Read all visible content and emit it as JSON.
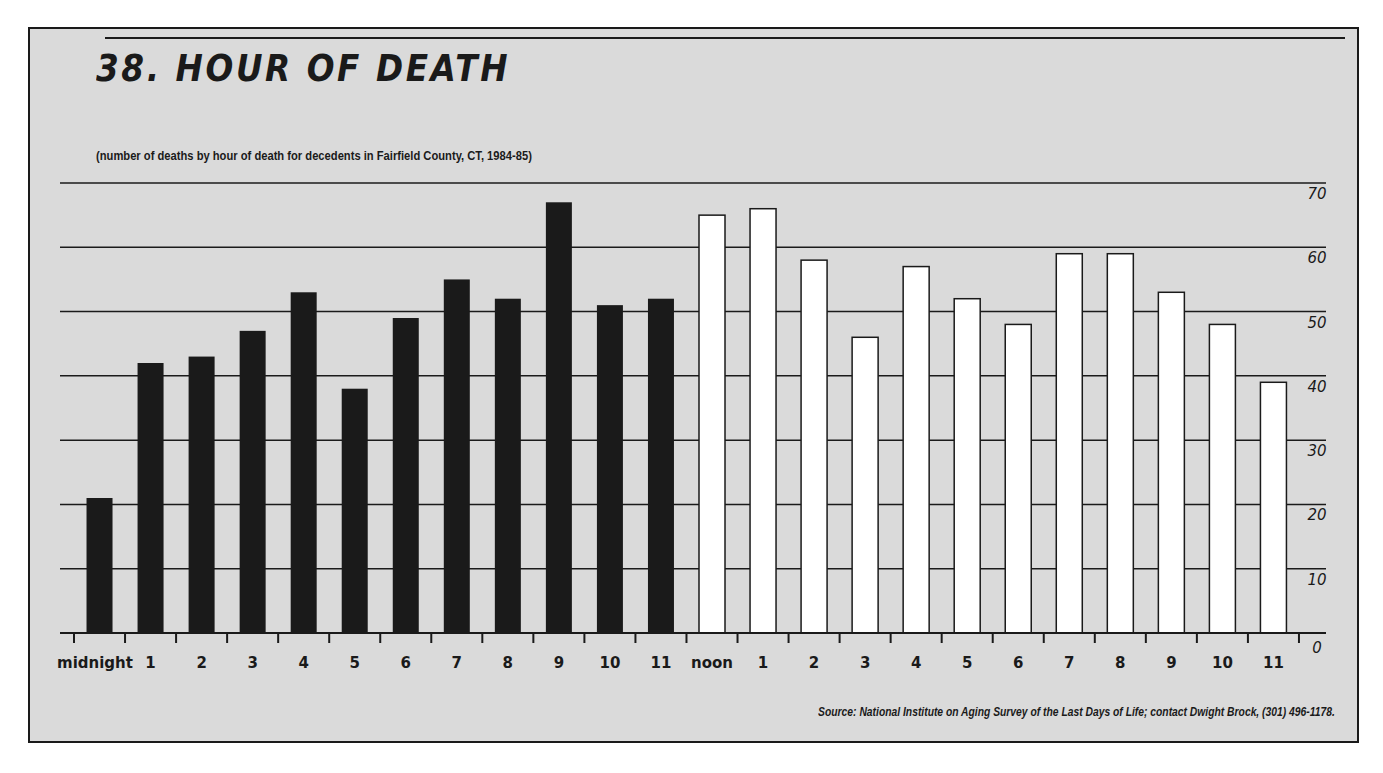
{
  "header": {
    "title": "38. HOUR OF DEATH",
    "subtitle": "(number of deaths by hour of death for decedents in Fairfield County, CT, 1984-85)"
  },
  "footer": {
    "source": "Source:  National Institute on Aging Survey of the Last Days of Life; contact Dwight Brock, (301) 496-1178."
  },
  "colors": {
    "background": "#dadada",
    "am_bar": "#1a1a1a",
    "pm_bar": "#ffffff",
    "ink": "#1a1a1a"
  },
  "chart_data": {
    "type": "bar",
    "title": "38. HOUR OF DEATH",
    "subtitle": "(number of deaths by hour of death for decedents in Fairfield County, CT, 1984-85)",
    "xlabel": "",
    "ylabel": "",
    "ylim": [
      0,
      70
    ],
    "yticks": [
      0,
      10,
      20,
      30,
      40,
      50,
      60,
      70
    ],
    "y_axis_position": "right",
    "grid": true,
    "categories": [
      "midnight",
      "1",
      "2",
      "3",
      "4",
      "5",
      "6",
      "7",
      "8",
      "9",
      "10",
      "11",
      "noon",
      "1",
      "2",
      "3",
      "4",
      "5",
      "6",
      "7",
      "8",
      "9",
      "10",
      "11"
    ],
    "series": [
      {
        "name": "AM (midnight-11am)",
        "color": "#1a1a1a",
        "values": [
          21,
          42,
          43,
          47,
          53,
          38,
          49,
          55,
          52,
          67,
          51,
          52,
          null,
          null,
          null,
          null,
          null,
          null,
          null,
          null,
          null,
          null,
          null,
          null
        ]
      },
      {
        "name": "PM (noon-11pm)",
        "color": "#ffffff",
        "values": [
          null,
          null,
          null,
          null,
          null,
          null,
          null,
          null,
          null,
          null,
          null,
          null,
          65,
          66,
          58,
          46,
          57,
          52,
          48,
          59,
          59,
          53,
          48,
          39
        ]
      }
    ],
    "values": [
      21,
      42,
      43,
      47,
      53,
      38,
      49,
      55,
      52,
      67,
      51,
      52,
      65,
      66,
      58,
      46,
      57,
      52,
      48,
      59,
      59,
      53,
      48,
      39
    ],
    "source": "Source:  National Institute on Aging Survey of the Last Days of Life; contact Dwight Brock, (301) 496-1178."
  }
}
